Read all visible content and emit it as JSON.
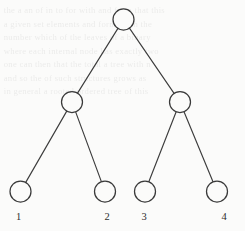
{
  "figure": {
    "background_color": "#fbfbfa",
    "stroke_color": "#3a3a3a",
    "label_color": "#2e2e2e",
    "width": 245,
    "height": 231
  },
  "chart_data": {
    "type": "diagram",
    "diagram_type": "binary-tree",
    "title": "",
    "xlabel": "",
    "ylabel": "",
    "node_radius": 10.5,
    "node_fill": "#fbfbfa",
    "node_stroke": "#3a3a3a",
    "edge_stroke": "#3d3d3d",
    "nodes": [
      {
        "id": "root",
        "label": "",
        "level": 0,
        "cx": 123.5,
        "cy": 19.5,
        "r": 10.5
      },
      {
        "id": "n-left",
        "label": "",
        "level": 1,
        "cx": 72.0,
        "cy": 102.0,
        "r": 10.5
      },
      {
        "id": "n-right",
        "label": "",
        "level": 1,
        "cx": 180.0,
        "cy": 102.0,
        "r": 10.5
      },
      {
        "id": "leaf-1",
        "label": "1",
        "level": 2,
        "cx": 20.5,
        "cy": 191.5,
        "r": 10.5
      },
      {
        "id": "leaf-2",
        "label": "2",
        "level": 2,
        "cx": 105.0,
        "cy": 191.5,
        "r": 10.5
      },
      {
        "id": "leaf-3",
        "label": "3",
        "level": 2,
        "cx": 145.0,
        "cy": 191.5,
        "r": 10.5
      },
      {
        "id": "leaf-4",
        "label": "4",
        "level": 2,
        "cx": 217.0,
        "cy": 191.5,
        "r": 10.5
      }
    ],
    "edges": [
      {
        "from": "root",
        "to": "n-left"
      },
      {
        "from": "root",
        "to": "n-right"
      },
      {
        "from": "n-left",
        "to": "leaf-1"
      },
      {
        "from": "n-left",
        "to": "leaf-2"
      },
      {
        "from": "n-right",
        "to": "leaf-3"
      },
      {
        "from": "n-right",
        "to": "leaf-4"
      }
    ],
    "leaf_labels": [
      {
        "text": "1",
        "x": 18.5,
        "y": 220.0
      },
      {
        "text": "2",
        "x": 107.0,
        "y": 220.0
      },
      {
        "text": "3",
        "x": 144.0,
        "y": 220.0
      },
      {
        "text": "4",
        "x": 224.0,
        "y": 220.0
      }
    ]
  },
  "background_text": {
    "lines": [
      "the a an of in to for with and from that this",
      "a given set elements and forming in the",
      "number which of the leaves of a binary",
      "where each internal node has exactly two",
      "one can then that the total a tree with n",
      "and so the of such structures grows as",
      "in general a rooted ordered tree of this"
    ]
  }
}
